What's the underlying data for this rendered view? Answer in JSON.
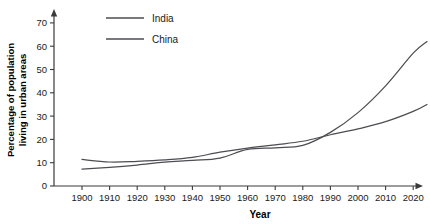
{
  "chart_data": {
    "type": "line",
    "title": "",
    "xlabel": "Year",
    "ylabel": "Percentage of population living in urban areas",
    "ylabel_line1": "Percentage of population",
    "ylabel_line2": "living in urban areas",
    "x": [
      1900,
      1910,
      1920,
      1930,
      1940,
      1950,
      1960,
      1970,
      1980,
      1990,
      2000,
      2010,
      2020,
      2025
    ],
    "xlim": [
      1896,
      2028
    ],
    "ylim": [
      0,
      75
    ],
    "yticks": [
      0,
      10,
      20,
      30,
      40,
      50,
      60,
      70
    ],
    "xticks": [
      1900,
      1910,
      1920,
      1930,
      1940,
      1950,
      1960,
      1970,
      1980,
      1990,
      2000,
      2010,
      2020
    ],
    "xtick_labels": [
      "1900",
      "1910",
      "1920",
      "1930",
      "1940",
      "1950",
      "1960",
      "1970",
      "1980",
      "1990",
      "2000",
      "2010",
      "2020"
    ],
    "ytick_labels": [
      "0",
      "10",
      "20",
      "30",
      "40",
      "50",
      "60",
      "70"
    ],
    "grid": false,
    "legend_position": "top-center",
    "series": [
      {
        "name": "India",
        "color": "#4d4d52",
        "values": [
          11.4,
          10.3,
          10.6,
          11.2,
          12.3,
          14.5,
          16.3,
          17.7,
          19.2,
          22.0,
          24.5,
          27.6,
          32.0,
          35.0
        ]
      },
      {
        "name": "China",
        "color": "#4d4d52",
        "values": [
          7.2,
          8.0,
          9.0,
          10.2,
          11.0,
          12.0,
          15.7,
          16.4,
          17.4,
          23.0,
          31.5,
          43.0,
          57.0,
          62.0
        ]
      }
    ]
  },
  "legend": {
    "items": [
      {
        "label": "India"
      },
      {
        "label": "China"
      }
    ]
  },
  "axes": {
    "x_title": "Year",
    "y_title_line1": "Percentage of population",
    "y_title_line2": "living in urban areas"
  }
}
